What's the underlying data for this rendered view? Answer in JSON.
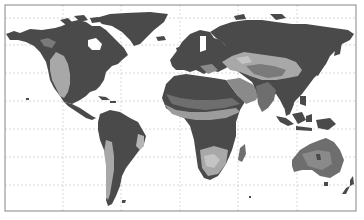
{
  "map": {
    "type": "world-map",
    "projection": "equirectangular",
    "style": "grayscale shaded relief / land-cover",
    "frame": {
      "x": 5,
      "y": 5,
      "width": 351,
      "height": 206,
      "color": "#9a9a9a"
    },
    "gridlines": {
      "style": "dotted",
      "color": "#c8c8c8",
      "latitude_y": [
        18,
        45,
        73,
        101,
        129,
        157,
        185
      ],
      "longitude_x": [
        63,
        121,
        180,
        238,
        297
      ]
    },
    "colors": {
      "ocean": "#ffffff",
      "land_dark": "#4a4a4a",
      "land_mid": "#6e6e6e",
      "land_light": "#9c9c9c",
      "land_pale": "#c4c4c4"
    },
    "regions": [
      {
        "name": "North America",
        "shade": "dark",
        "highlight": "light western interior (Great Plains/Rockies)"
      },
      {
        "name": "Greenland",
        "shade": "dark"
      },
      {
        "name": "South America",
        "shade": "dark",
        "highlight": "light Andes strip and eastern Brazil"
      },
      {
        "name": "Europe",
        "shade": "dark"
      },
      {
        "name": "Africa",
        "shade": "dark",
        "highlight": "light Sahel band and southern Africa"
      },
      {
        "name": "Asia",
        "shade": "dark",
        "highlight": "light Central Asia / Tibetan plateau"
      },
      {
        "name": "Australia",
        "shade": "mid",
        "highlight": "mid-gray interior"
      },
      {
        "name": "New Zealand",
        "shade": "dark"
      },
      {
        "name": "Indonesia",
        "shade": "dark"
      }
    ]
  }
}
